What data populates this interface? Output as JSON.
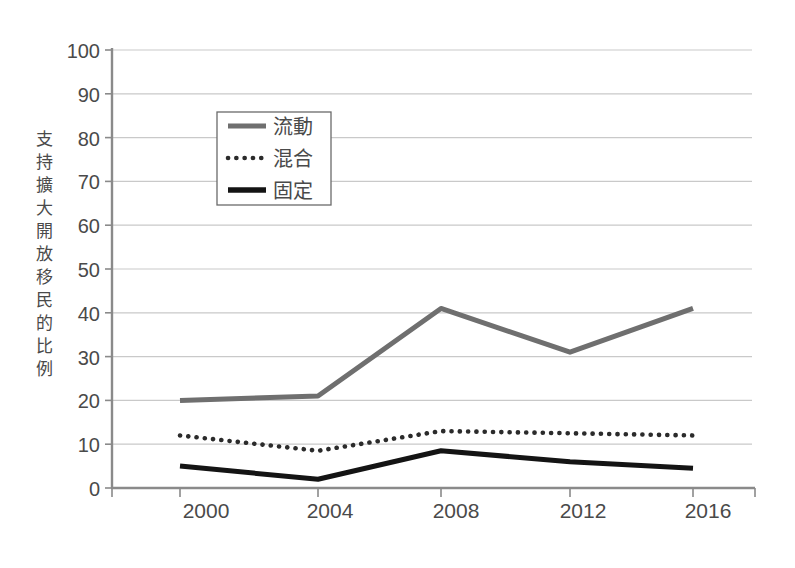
{
  "chart_data": {
    "type": "line",
    "title": "",
    "subtitle": "",
    "xlabel": "",
    "ylabel": "支持擴大開放移民的比例",
    "x": [
      2000,
      2004,
      2008,
      2012,
      2016
    ],
    "categories": [
      "2000",
      "2004",
      "2008",
      "2012",
      "2016"
    ],
    "xlim": [
      1998,
      2018
    ],
    "ylim": [
      0,
      100
    ],
    "yticks": [
      0,
      10,
      20,
      30,
      40,
      50,
      60,
      70,
      80,
      90,
      100
    ],
    "ytick_labels": [
      "0",
      "10",
      "20",
      "30",
      "40",
      "50",
      "60",
      "70",
      "80",
      "90",
      "100"
    ],
    "xtick_labels": [
      "2000",
      "2004",
      "2008",
      "2012",
      "2016"
    ],
    "grid": true,
    "grid_axis": "y",
    "legend_position": "upper-left-inside",
    "series": [
      {
        "name": "流動",
        "style": "solid",
        "color": "#6f6f6f",
        "width": 5,
        "values": [
          20,
          21,
          41,
          31,
          41
        ]
      },
      {
        "name": "混合",
        "style": "dotted",
        "color": "#2b2b2b",
        "width": 4,
        "values": [
          12,
          8.5,
          13,
          12.5,
          12
        ]
      },
      {
        "name": "固定",
        "style": "solid",
        "color": "#141414",
        "width": 5,
        "values": [
          5,
          2,
          8.5,
          6,
          4.5
        ]
      }
    ]
  },
  "axes": {
    "y_axis_label_chars": [
      "支",
      "持",
      "擴",
      "大",
      "開",
      "放",
      "移",
      "民",
      "的",
      "比",
      "例"
    ],
    "y_tick_0": "0",
    "y_tick_10": "10",
    "y_tick_20": "20",
    "y_tick_30": "30",
    "y_tick_40": "40",
    "y_tick_50": "50",
    "y_tick_60": "60",
    "y_tick_70": "70",
    "y_tick_80": "80",
    "y_tick_90": "90",
    "y_tick_100": "100",
    "x_tick_0": "2000",
    "x_tick_1": "2004",
    "x_tick_2": "2008",
    "x_tick_3": "2012",
    "x_tick_4": "2016"
  },
  "legend": {
    "entries": [
      {
        "label": "流動",
        "style": "solid-gray"
      },
      {
        "label": "混合",
        "style": "dotted-black"
      },
      {
        "label": "固定",
        "style": "solid-black"
      }
    ],
    "entry_0_label": "流動",
    "entry_1_label": "混合",
    "entry_2_label": "固定"
  },
  "colors": {
    "background": "#ffffff",
    "grid": "#c9c9c9",
    "axis": "#8a8a8a",
    "series_fluid": "#6f6f6f",
    "series_mixed": "#2b2b2b",
    "series_fixed": "#141414",
    "text": "#4a4a4a"
  }
}
